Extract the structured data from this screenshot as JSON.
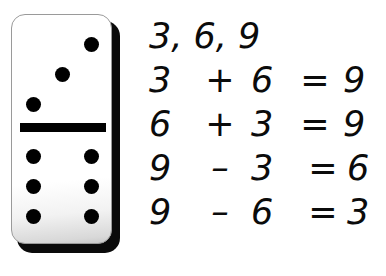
{
  "background_color": "#ffffff",
  "ink_color": "#0b0b0b",
  "domino": {
    "label": "domino-tile",
    "top_half_pips": 3,
    "bottom_half_pips": 6,
    "tile_color": "#ffffff",
    "pip_color": "#000000",
    "divider_color": "#000000",
    "shadow_color": "#0a0a0a",
    "border_color": "#9a9a9a"
  },
  "fact_family": {
    "numbers_line": "3, 6, 9",
    "equations": [
      {
        "operand_a": "3",
        "operator": "+",
        "operand_b": "6",
        "equals": "=",
        "result": "9",
        "kind": "addition"
      },
      {
        "operand_a": "6",
        "operator": "+",
        "operand_b": "3",
        "equals": "=",
        "result": "9",
        "kind": "addition"
      },
      {
        "operand_a": "9",
        "operator": "–",
        "operand_b": "3",
        "equals": "=",
        "result": "6",
        "kind": "subtraction"
      },
      {
        "operand_a": "9",
        "operator": "–",
        "operand_b": "6",
        "equals": "=",
        "result": "3",
        "kind": "subtraction"
      }
    ]
  }
}
